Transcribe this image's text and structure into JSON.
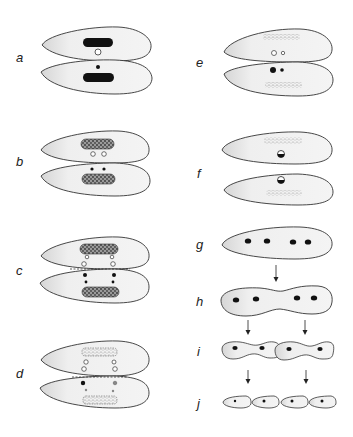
{
  "figure": {
    "panels": [
      {
        "id": "a",
        "label": "a",
        "stage": "two conjugating cells, dense macronuclei, one open and one solid micronucleus"
      },
      {
        "id": "b",
        "label": "b",
        "stage": "granular macronuclei, two micronuclei per cell"
      },
      {
        "id": "c",
        "label": "c",
        "stage": "micronuclear divisions across the junction (dashed line)"
      },
      {
        "id": "d",
        "label": "d",
        "stage": "fragmenting macronuclei, exchanged pronuclei"
      },
      {
        "id": "e",
        "label": "e",
        "stage": "dispersed macronuclear fragments, pronuclei"
      },
      {
        "id": "f",
        "label": "f",
        "stage": "separated exconjugants with fused synkaryon"
      },
      {
        "id": "g",
        "label": "g",
        "stage": "single cell with four nuclei"
      },
      {
        "id": "h",
        "label": "h",
        "stage": "cell constricting into two"
      },
      {
        "id": "i",
        "label": "i",
        "stage": "two constricting cells, two nuclei each"
      },
      {
        "id": "j",
        "label": "j",
        "stage": "four daughter cells, one nucleus each"
      }
    ],
    "colors": {
      "outline": "#333333",
      "cell_fill": "#eeeeee",
      "nucleus": "#111111",
      "background": "#ffffff"
    }
  }
}
